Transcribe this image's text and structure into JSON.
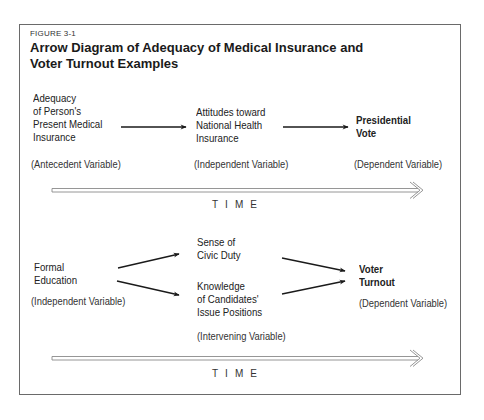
{
  "figure": {
    "label": "FIGURE 3-1",
    "title_line1": "Arrow Diagram of Adequacy of Medical Insurance and",
    "title_line2": "Voter Turnout Examples"
  },
  "diagram_top": {
    "nodes": [
      {
        "id": "adequacy",
        "lines": [
          "Adequacy",
          "of Person's",
          "Present Medical",
          "Insurance"
        ],
        "role": "(Antecedent Variable)",
        "bold": false
      },
      {
        "id": "attitudes",
        "lines": [
          "Attitudes toward",
          "National Health",
          "Insurance"
        ],
        "role": "(Independent Variable)",
        "bold": false
      },
      {
        "id": "vote",
        "lines": [
          "Presidential",
          "Vote"
        ],
        "role": "(Dependent Variable)",
        "bold": true
      }
    ],
    "edges": [
      {
        "from": "adequacy",
        "to": "attitudes"
      },
      {
        "from": "attitudes",
        "to": "vote"
      }
    ],
    "time_label": "TIME"
  },
  "diagram_bottom": {
    "nodes": [
      {
        "id": "education",
        "lines": [
          "Formal",
          "Education"
        ],
        "role": "(Independent Variable)",
        "bold": false
      },
      {
        "id": "civic",
        "lines": [
          "Sense of",
          "Civic Duty"
        ],
        "role": "",
        "bold": false
      },
      {
        "id": "knowledge",
        "lines": [
          "Knowledge",
          "of Candidates'",
          "Issue Positions"
        ],
        "role": "(Intervening Variable)",
        "bold": false
      },
      {
        "id": "turnout",
        "lines": [
          "Voter",
          "Turnout"
        ],
        "role": "(Dependent Variable)",
        "bold": true
      }
    ],
    "edges": [
      {
        "from": "education",
        "to": "civic"
      },
      {
        "from": "education",
        "to": "knowledge"
      },
      {
        "from": "civic",
        "to": "turnout"
      },
      {
        "from": "knowledge",
        "to": "turnout"
      }
    ],
    "time_label": "TIME"
  }
}
